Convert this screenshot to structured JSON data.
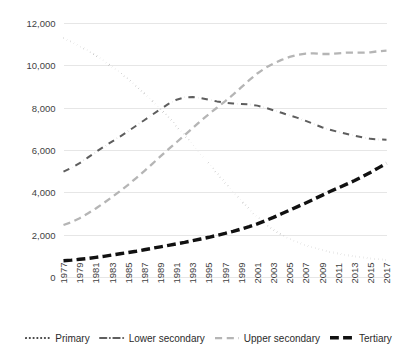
{
  "chart_data": {
    "type": "line",
    "title": "",
    "xlabel": "",
    "ylabel": "",
    "ylim": [
      0,
      12000
    ],
    "yticks": [
      0,
      2000,
      4000,
      6000,
      8000,
      10000,
      12000
    ],
    "ytick_labels": [
      "0",
      "2,000",
      "4,000",
      "6,000",
      "8,000",
      "10,000",
      "12,000"
    ],
    "grid": true,
    "legend_position": "bottom",
    "x": [
      1977,
      1978,
      1979,
      1980,
      1981,
      1982,
      1983,
      1984,
      1985,
      1986,
      1987,
      1988,
      1989,
      1990,
      1991,
      1992,
      1993,
      1994,
      1995,
      1996,
      1997,
      1998,
      1999,
      2000,
      2001,
      2002,
      2003,
      2004,
      2005,
      2006,
      2007,
      2008,
      2009,
      2010,
      2011,
      2012,
      2013,
      2014,
      2015,
      2016,
      2017
    ],
    "xtick_labels": [
      "1977",
      "1979",
      "1981",
      "1983",
      "1985",
      "1987",
      "1989",
      "1991",
      "1993",
      "1995",
      "1997",
      "1999",
      "2001",
      "2003",
      "2005",
      "2007",
      "2009",
      "2011",
      "2013",
      "2015",
      "2017"
    ],
    "series": [
      {
        "name": "Primary",
        "style": "dotted",
        "color": "#404040",
        "width": 2.1,
        "values": [
          11300,
          11120,
          10930,
          10720,
          10480,
          10230,
          9960,
          9680,
          9370,
          9040,
          8700,
          8340,
          7960,
          7560,
          7150,
          6720,
          6280,
          5830,
          5380,
          4930,
          4480,
          4040,
          3620,
          3220,
          2860,
          2540,
          2260,
          2020,
          1820,
          1660,
          1520,
          1400,
          1300,
          1210,
          1130,
          1060,
          1000,
          950,
          900,
          860,
          830
        ]
      },
      {
        "name": "Lower secondary",
        "style": "dashdot",
        "color": "#5e5e5e",
        "width": 2.0,
        "values": [
          5000,
          5180,
          5400,
          5660,
          5930,
          6180,
          6420,
          6660,
          6910,
          7170,
          7430,
          7690,
          7950,
          8200,
          8400,
          8510,
          8530,
          8480,
          8400,
          8320,
          8260,
          8220,
          8200,
          8180,
          8120,
          8020,
          7900,
          7780,
          7660,
          7540,
          7400,
          7250,
          7100,
          6980,
          6880,
          6790,
          6700,
          6620,
          6550,
          6520,
          6510
        ]
      },
      {
        "name": "Upper secondary",
        "style": "dashed",
        "color": "#b5b5b5",
        "width": 2.3,
        "values": [
          2480,
          2620,
          2800,
          3020,
          3260,
          3520,
          3800,
          4080,
          4380,
          4700,
          5030,
          5370,
          5720,
          6060,
          6390,
          6720,
          7060,
          7400,
          7720,
          8020,
          8320,
          8640,
          8980,
          9320,
          9640,
          9900,
          10110,
          10280,
          10420,
          10520,
          10580,
          10590,
          10560,
          10560,
          10590,
          10620,
          10620,
          10620,
          10640,
          10690,
          10720
        ]
      },
      {
        "name": "Tertiary",
        "style": "thick-dashed",
        "color": "#111111",
        "width": 3.4,
        "values": [
          790,
          820,
          860,
          900,
          950,
          1000,
          1060,
          1120,
          1180,
          1240,
          1310,
          1380,
          1450,
          1520,
          1590,
          1660,
          1740,
          1820,
          1900,
          1990,
          2080,
          2180,
          2290,
          2400,
          2530,
          2680,
          2840,
          3010,
          3180,
          3350,
          3520,
          3700,
          3880,
          4060,
          4230,
          4400,
          4570,
          4760,
          4960,
          5180,
          5400
        ]
      }
    ]
  }
}
